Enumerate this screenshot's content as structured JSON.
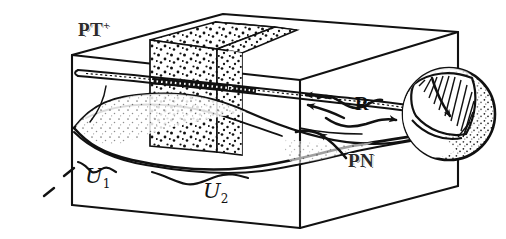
{
  "figure": {
    "kind": "hand-drawn mathematical diagram",
    "background_color": "#ffffff",
    "ink_color": "#111111",
    "labels": {
      "box_top_label": "PT",
      "box_top_label_superscript": "+",
      "surface_label": "PN",
      "map_label": "R",
      "region_1": "U",
      "region_1_subscript": "1",
      "region_2": "U",
      "region_2_subscript": "2"
    },
    "objects": {
      "box": {
        "name": "3D rectangular box (wireframe, hand drawn)",
        "top_face_label": "PT+"
      },
      "slabs": {
        "name": "two stippled vertical slabs inside the box",
        "count": 2,
        "fill": "stipple dots"
      },
      "tube": {
        "name": "thin horizontal rod / tube spanning the box interior"
      },
      "wavy_surface": {
        "name": "wavy sheet surface across the lower interior of the box",
        "label": "PN"
      },
      "braces": {
        "name": "two under-braces marking intervals on the wavy surface",
        "labels": [
          "U1",
          "U2"
        ]
      },
      "sphere": {
        "name": "stippled sphere with a banded strip and an arrow along the band",
        "texture": "stipple shading"
      },
      "arrows": {
        "pointers_into_box": 2,
        "map_arrow_label": "R",
        "pn_callout_arrow": 1
      }
    }
  }
}
